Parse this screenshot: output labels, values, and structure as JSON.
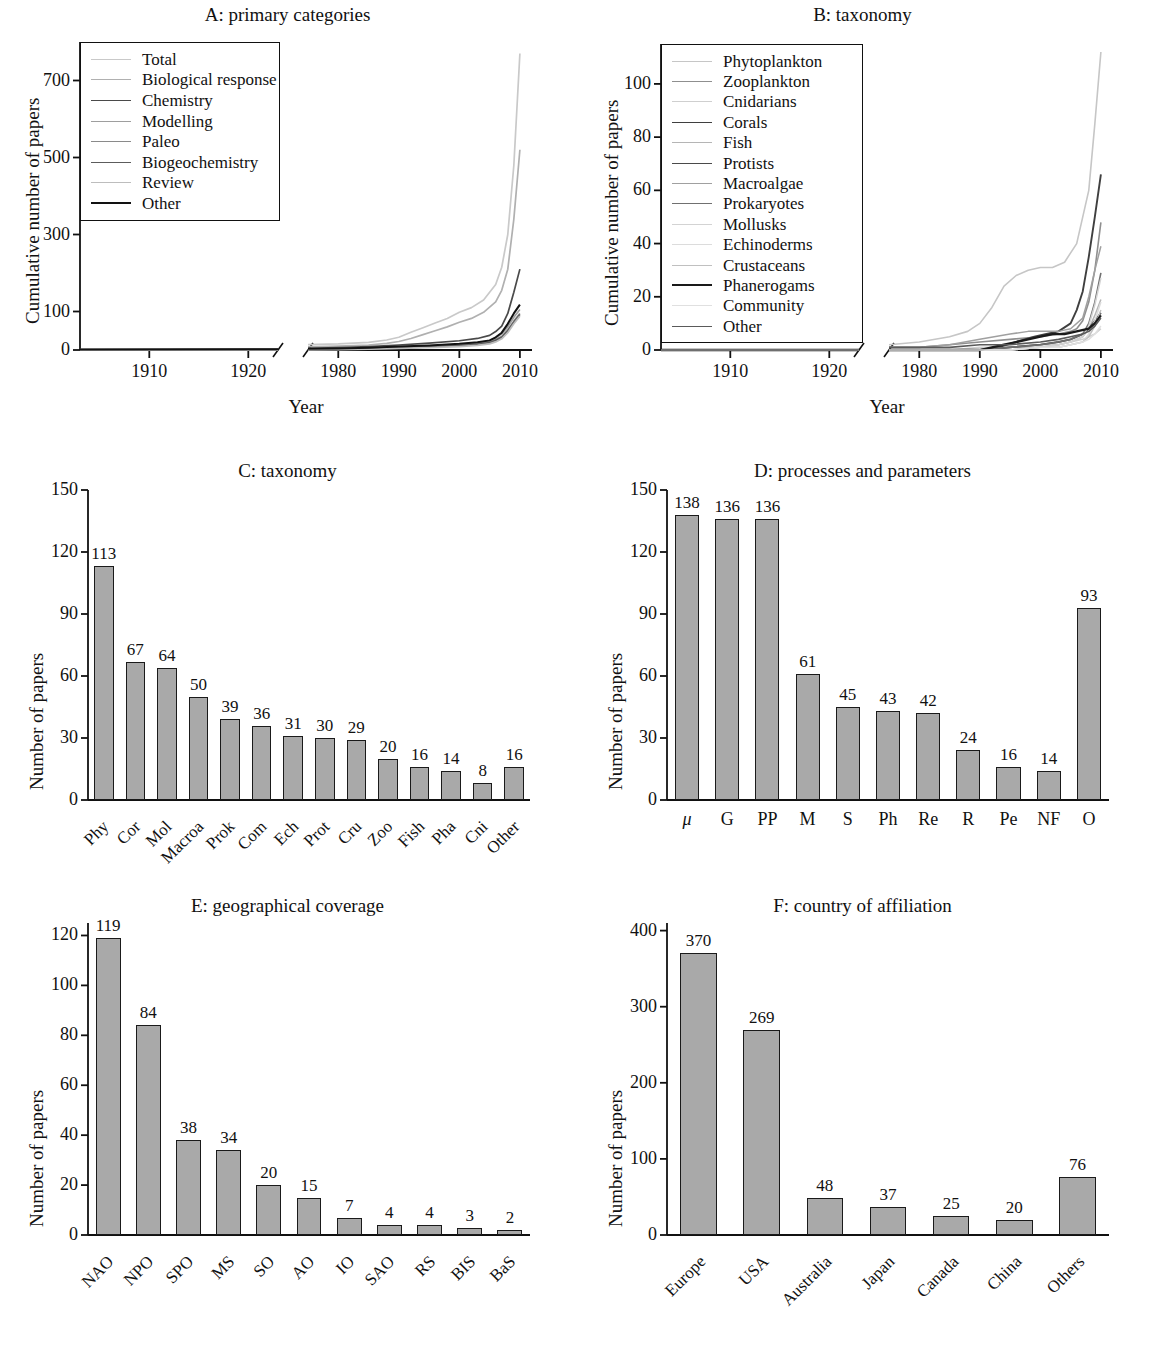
{
  "figure": {
    "xlabel_year": "Year",
    "ylabel_cumulative": "Cumulative number of papers",
    "ylabel_number": "Number of papers"
  },
  "chart_data": [
    {
      "id": "A",
      "type": "line",
      "title": "A: primary categories",
      "xlabel": "Year",
      "ylabel": "Cumulative number of papers",
      "ylim": [
        0,
        800
      ],
      "yticks": [
        0,
        100,
        300,
        500,
        700
      ],
      "xticks_left": [
        1910,
        1920
      ],
      "xticks_right": [
        1980,
        1990,
        2000,
        2010
      ],
      "xlim_left": [
        1903,
        1923
      ],
      "xlim_right": [
        1975,
        2012
      ],
      "axis_break": true,
      "grid": false,
      "legend_position": "upper-left-inside",
      "series": [
        {
          "name": "Total",
          "color": "#c9c9c9",
          "width": 1.7,
          "x": [
            1903,
            1923,
            1975,
            1980,
            1985,
            1988,
            1990,
            1992,
            1994,
            1996,
            1998,
            2000,
            2002,
            2004,
            2006,
            2007,
            2008,
            2009,
            2010
          ],
          "y": [
            1,
            2,
            14,
            16,
            20,
            26,
            33,
            46,
            58,
            70,
            82,
            98,
            110,
            130,
            170,
            215,
            300,
            480,
            770
          ]
        },
        {
          "name": "Biological response",
          "color": "#b0b0b0",
          "width": 1.7,
          "x": [
            1903,
            1923,
            1975,
            1980,
            1985,
            1988,
            1990,
            1992,
            1994,
            1996,
            1998,
            2000,
            2002,
            2004,
            2006,
            2007,
            2008,
            2009,
            2010
          ],
          "y": [
            0,
            0,
            8,
            10,
            13,
            17,
            22,
            30,
            40,
            50,
            60,
            72,
            82,
            98,
            125,
            155,
            210,
            340,
            520
          ]
        },
        {
          "name": "Chemistry",
          "color": "#4a4a4a",
          "width": 1.7,
          "x": [
            1903,
            1923,
            1975,
            1980,
            1985,
            1990,
            1995,
            2000,
            2003,
            2005,
            2006,
            2007,
            2008,
            2009,
            2010
          ],
          "y": [
            1,
            2,
            4,
            6,
            9,
            13,
            18,
            24,
            30,
            38,
            48,
            62,
            95,
            150,
            210
          ]
        },
        {
          "name": "Modelling",
          "color": "#9e9e9e",
          "width": 1.7,
          "x": [
            1903,
            1923,
            1975,
            1980,
            1985,
            1990,
            1995,
            2000,
            2003,
            2005,
            2006,
            2007,
            2008,
            2009,
            2010
          ],
          "y": [
            0,
            0,
            2,
            3,
            5,
            8,
            11,
            15,
            19,
            24,
            32,
            42,
            60,
            85,
            105
          ]
        },
        {
          "name": "Paleo",
          "color": "#8a8a8a",
          "width": 1.7,
          "x": [
            1903,
            1923,
            1975,
            1980,
            1985,
            1990,
            1995,
            2000,
            2003,
            2005,
            2006,
            2007,
            2008,
            2009,
            2010
          ],
          "y": [
            0,
            0,
            1,
            2,
            4,
            6,
            9,
            13,
            17,
            21,
            27,
            35,
            52,
            75,
            95
          ]
        },
        {
          "name": "Biogeochemistry",
          "color": "#5c5c5c",
          "width": 1.7,
          "x": [
            1903,
            1923,
            1975,
            1980,
            1985,
            1990,
            1995,
            2000,
            2003,
            2005,
            2006,
            2007,
            2008,
            2009,
            2010
          ],
          "y": [
            0,
            0,
            1,
            2,
            3,
            5,
            8,
            11,
            15,
            19,
            25,
            33,
            50,
            72,
            92
          ]
        },
        {
          "name": "Review",
          "color": "#bdbdbd",
          "width": 1.7,
          "x": [
            1903,
            1923,
            1975,
            1980,
            1985,
            1990,
            1995,
            2000,
            2003,
            2005,
            2006,
            2007,
            2008,
            2009,
            2010
          ],
          "y": [
            0,
            0,
            1,
            1,
            2,
            4,
            6,
            9,
            12,
            16,
            21,
            29,
            45,
            68,
            88
          ]
        },
        {
          "name": "Other",
          "color": "#121212",
          "width": 2.0,
          "x": [
            1903,
            1923,
            1975,
            1980,
            1985,
            1990,
            1995,
            2000,
            2003,
            2005,
            2006,
            2007,
            2008,
            2009,
            2010
          ],
          "y": [
            1,
            2,
            3,
            4,
            6,
            9,
            12,
            16,
            20,
            25,
            33,
            45,
            68,
            95,
            118
          ]
        }
      ]
    },
    {
      "id": "B",
      "type": "line",
      "title": "B: taxonomy",
      "xlabel": "Year",
      "ylabel": "Cumulative number of papers",
      "ylim": [
        0,
        115
      ],
      "yticks": [
        0,
        20,
        40,
        60,
        80,
        100
      ],
      "xticks_left": [
        1910,
        1920
      ],
      "xticks_right": [
        1980,
        1990,
        2000,
        2010
      ],
      "xlim_left": [
        1903,
        1923
      ],
      "xlim_right": [
        1975,
        2012
      ],
      "axis_break": true,
      "grid": false,
      "legend_position": "upper-left-inside",
      "series": [
        {
          "name": "Phytoplankton",
          "color": "#c6c6c6",
          "width": 1.6,
          "x": [
            1903,
            1923,
            1975,
            1980,
            1985,
            1988,
            1990,
            1992,
            1994,
            1996,
            1998,
            2000,
            2002,
            2004,
            2006,
            2008,
            2009,
            2010
          ],
          "y": [
            0,
            0,
            2,
            3,
            5,
            7,
            10,
            16,
            24,
            28,
            30,
            31,
            31,
            33,
            40,
            60,
            85,
            112
          ]
        },
        {
          "name": "Zooplankton",
          "color": "#8f8f8f",
          "width": 1.6,
          "x": [
            1903,
            1923,
            1975,
            1980,
            1985,
            1990,
            1995,
            2000,
            2003,
            2005,
            2006,
            2007,
            2008,
            2009,
            2010
          ],
          "y": [
            0,
            0,
            1,
            1,
            2,
            3,
            4,
            5,
            6,
            7,
            8,
            11,
            18,
            30,
            48
          ]
        },
        {
          "name": "Cnidarians",
          "color": "#cfcfcf",
          "width": 1.5,
          "x": [
            1903,
            1923,
            1975,
            1980,
            1985,
            1990,
            1995,
            2000,
            2003,
            2005,
            2007,
            2008,
            2009,
            2010
          ],
          "y": [
            0,
            0,
            0,
            0,
            0,
            1,
            1,
            2,
            2,
            3,
            4,
            5,
            6,
            8
          ]
        },
        {
          "name": "Corals",
          "color": "#3f3f3f",
          "width": 1.9,
          "x": [
            1903,
            1923,
            1975,
            1980,
            1985,
            1990,
            1993,
            1996,
            1999,
            2001,
            2003,
            2005,
            2006,
            2007,
            2008,
            2009,
            2010
          ],
          "y": [
            0,
            0,
            0,
            0,
            0,
            0,
            1,
            3,
            5,
            6,
            7,
            10,
            15,
            22,
            35,
            50,
            66
          ]
        },
        {
          "name": "Fish",
          "color": "#b5b5b5",
          "width": 1.5,
          "x": [
            1903,
            1923,
            1975,
            1980,
            1985,
            1990,
            1995,
            2000,
            2003,
            2005,
            2007,
            2008,
            2009,
            2010
          ],
          "y": [
            0,
            0,
            0,
            0,
            0,
            0,
            1,
            1,
            2,
            3,
            5,
            8,
            13,
            19
          ]
        },
        {
          "name": "Protists",
          "color": "#4a4a4a",
          "width": 1.9,
          "x": [
            1903,
            1923,
            1975,
            1980,
            1985,
            1990,
            1995,
            2000,
            2003,
            2005,
            2007,
            2008,
            2009,
            2010
          ],
          "y": [
            0,
            0,
            0,
            0,
            0,
            0,
            1,
            2,
            3,
            4,
            6,
            8,
            11,
            14
          ]
        },
        {
          "name": "Macroalgae",
          "color": "#a0a0a0",
          "width": 1.5,
          "x": [
            1903,
            1923,
            1975,
            1980,
            1985,
            1990,
            1995,
            1998,
            2000,
            2003,
            2005,
            2007,
            2008,
            2009,
            2010
          ],
          "y": [
            0,
            0,
            1,
            1,
            2,
            4,
            6,
            7,
            7,
            7,
            8,
            12,
            20,
            30,
            39
          ]
        },
        {
          "name": "Prokaryotes",
          "color": "#707070",
          "width": 1.6,
          "x": [
            1903,
            1923,
            1975,
            1980,
            1985,
            1990,
            1995,
            2000,
            2003,
            2005,
            2007,
            2008,
            2009,
            2010
          ],
          "y": [
            0,
            0,
            0,
            0,
            0,
            0,
            1,
            2,
            3,
            4,
            6,
            10,
            18,
            29
          ]
        },
        {
          "name": "Mollusks",
          "color": "#d3d3d3",
          "width": 1.5,
          "x": [
            1903,
            1923,
            1975,
            1980,
            1985,
            1990,
            1995,
            2000,
            2003,
            2005,
            2007,
            2008,
            2009,
            2010
          ],
          "y": [
            0,
            0,
            0,
            0,
            0,
            0,
            0,
            1,
            2,
            3,
            5,
            9,
            17,
            27
          ]
        },
        {
          "name": "Echinoderms",
          "color": "#dcdcdc",
          "width": 1.5,
          "x": [
            1903,
            1923,
            1975,
            1980,
            1985,
            1990,
            1995,
            2000,
            2003,
            2005,
            2007,
            2008,
            2009,
            2010
          ],
          "y": [
            0,
            0,
            0,
            0,
            0,
            0,
            0,
            1,
            1,
            2,
            3,
            6,
            11,
            18
          ]
        },
        {
          "name": "Crustaceans",
          "color": "#c0c0c0",
          "width": 1.5,
          "x": [
            1903,
            1923,
            1975,
            1980,
            1985,
            1990,
            1995,
            2000,
            2003,
            2005,
            2007,
            2008,
            2009,
            2010
          ],
          "y": [
            0,
            0,
            0,
            0,
            0,
            0,
            0,
            1,
            1,
            2,
            3,
            5,
            9,
            15
          ]
        },
        {
          "name": "Phanerogams",
          "color": "#1a1a1a",
          "width": 2.3,
          "x": [
            1903,
            1923,
            1975,
            1980,
            1985,
            1990,
            1992,
            1994,
            1996,
            1998,
            2000,
            2002,
            2004,
            2006,
            2008,
            2009,
            2010
          ],
          "y": [
            0,
            0,
            0,
            0,
            0,
            0,
            1,
            2,
            3,
            4,
            5,
            6,
            6,
            7,
            8,
            10,
            13
          ]
        },
        {
          "name": "Community",
          "color": "#e0e0e0",
          "width": 1.5,
          "x": [
            1903,
            1923,
            1975,
            1980,
            1985,
            1990,
            1995,
            2000,
            2003,
            2005,
            2007,
            2008,
            2009,
            2010
          ],
          "y": [
            0,
            0,
            0,
            0,
            0,
            0,
            0,
            1,
            1,
            2,
            3,
            4,
            6,
            9
          ]
        },
        {
          "name": "Other",
          "color": "#5a5a5a",
          "width": 1.6,
          "x": [
            1903,
            1923,
            1975,
            1980,
            1985,
            1990,
            1995,
            2000,
            2003,
            2005,
            2007,
            2008,
            2009,
            2010
          ],
          "y": [
            0,
            0,
            1,
            1,
            1,
            2,
            2,
            3,
            4,
            5,
            6,
            7,
            9,
            12
          ]
        }
      ]
    },
    {
      "id": "C",
      "type": "bar",
      "title": "C: taxonomy",
      "xlabel": "",
      "ylabel": "Number of papers",
      "ylim": [
        0,
        150
      ],
      "yticks": [
        0,
        30,
        60,
        90,
        120,
        150
      ],
      "categories": [
        "Phy",
        "Cor",
        "Mol",
        "Macroa",
        "Prok",
        "Com",
        "Ech",
        "Prot",
        "Cru",
        "Zoo",
        "Fish",
        "Pha",
        "Cni",
        "Other"
      ],
      "values": [
        113,
        67,
        64,
        50,
        39,
        36,
        31,
        30,
        29,
        20,
        16,
        14,
        8,
        16
      ],
      "bar_color": "#a9a9a9",
      "bar_edge": "#1a1a1a",
      "rotated_labels": true,
      "grid": false
    },
    {
      "id": "D",
      "type": "bar",
      "title": "D: processes and parameters",
      "xlabel": "",
      "ylabel": "Number of papers",
      "ylim": [
        0,
        150
      ],
      "yticks": [
        0,
        30,
        60,
        90,
        120,
        150
      ],
      "categories": [
        "μ",
        "G",
        "PP",
        "M",
        "S",
        "Ph",
        "Re",
        "R",
        "Pe",
        "NF",
        "O"
      ],
      "values": [
        138,
        136,
        136,
        61,
        45,
        43,
        42,
        24,
        16,
        14,
        93
      ],
      "bar_color": "#a9a9a9",
      "bar_edge": "#1a1a1a",
      "rotated_labels": false,
      "grid": false
    },
    {
      "id": "E",
      "type": "bar",
      "title": "E: geographical coverage",
      "xlabel": "",
      "ylabel": "Number of papers",
      "ylim": [
        0,
        125
      ],
      "yticks": [
        0,
        20,
        40,
        60,
        80,
        100,
        120
      ],
      "categories": [
        "NAO",
        "NPO",
        "SPO",
        "MS",
        "SO",
        "AO",
        "IO",
        "SAO",
        "RS",
        "BIS",
        "BaS"
      ],
      "values": [
        119,
        84,
        38,
        34,
        20,
        15,
        7,
        4,
        4,
        3,
        2
      ],
      "bar_color": "#a9a9a9",
      "bar_edge": "#1a1a1a",
      "rotated_labels": true,
      "grid": false
    },
    {
      "id": "F",
      "type": "bar",
      "title": "F: country of affiliation",
      "xlabel": "",
      "ylabel": "Number of papers",
      "ylim": [
        0,
        410
      ],
      "yticks": [
        0,
        100,
        200,
        300,
        400
      ],
      "categories": [
        "Europe",
        "USA",
        "Australia",
        "Japan",
        "Canada",
        "China",
        "Others"
      ],
      "values": [
        370,
        269,
        48,
        37,
        25,
        20,
        76
      ],
      "bar_color": "#a9a9a9",
      "bar_edge": "#1a1a1a",
      "rotated_labels": true,
      "grid": false
    }
  ]
}
